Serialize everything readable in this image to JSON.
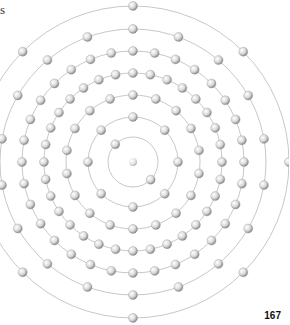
{
  "diagram": {
    "type": "bohr-atom-model",
    "corner_text": "s",
    "page_number": "167",
    "center": [
      133,
      162
    ],
    "nucleus_label": "",
    "shells": [
      {
        "radius": 25,
        "electrons": 2,
        "offset_deg": 135
      },
      {
        "radius": 45,
        "electrons": 8,
        "offset_deg": 0
      },
      {
        "radius": 67,
        "electrons": 18,
        "offset_deg": 0
      },
      {
        "radius": 89,
        "electrons": 32,
        "offset_deg": 0
      },
      {
        "radius": 111,
        "electrons": 32,
        "offset_deg": 0
      },
      {
        "radius": 133,
        "electrons": 18,
        "offset_deg": 0
      },
      {
        "radius": 156,
        "electrons": 8,
        "offset_deg": 0
      }
    ],
    "colors": {
      "orbit": "#c8c8c8",
      "electron_fill": "#d9d9d9",
      "electron_stroke": "#9a9a9a"
    }
  }
}
